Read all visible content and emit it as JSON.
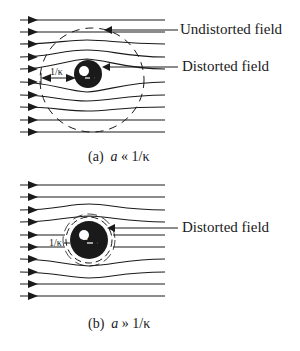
{
  "panels": [
    {
      "id": "a",
      "caption_prefix": "(a)",
      "caption_var": "a",
      "caption_rel": "«",
      "caption_rhs": "1/κ",
      "labels": {
        "undistorted": "Undistorted field",
        "distorted": "Distorted field"
      },
      "sphere_label": "a",
      "debye_label": "1/κ"
    },
    {
      "id": "b",
      "caption_prefix": "(b)",
      "caption_var": "a",
      "caption_rel": "»",
      "caption_rhs": "1/κ",
      "labels": {
        "distorted": "Distorted field"
      },
      "sphere_label": "a",
      "debye_label": "1/κ"
    }
  ],
  "colors": {
    "ink": "#1a1a1a",
    "background": "#ffffff"
  }
}
